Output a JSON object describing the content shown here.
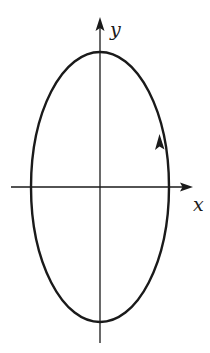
{
  "diagram": {
    "type": "ellipse-on-axes",
    "labels": {
      "x_axis": "x",
      "y_axis": "y"
    },
    "colors": {
      "stroke": "#1a1a1a",
      "background": "#ffffff"
    },
    "geometry": {
      "origin": [
        100,
        187
      ],
      "ellipse": {
        "cx": 100,
        "cy": 187,
        "rx": 69,
        "ry": 135
      },
      "x_axis": {
        "x1": 11,
        "x2": 192,
        "y": 187
      },
      "y_axis": {
        "x": 100,
        "y1": 343,
        "y2": 18
      },
      "direction_arrow": {
        "position": "right side, above x-axis",
        "orientation": "counter-clockwise (upward on right side)"
      }
    }
  }
}
